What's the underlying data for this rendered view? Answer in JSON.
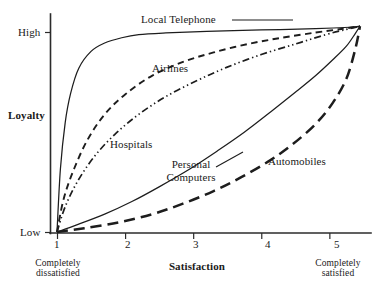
{
  "chart_data": {
    "type": "line",
    "title": "",
    "xlabel": "Satisfaction",
    "ylabel": "Loyalty",
    "xlim": [
      1,
      5.45
    ],
    "ylim": [
      0,
      1
    ],
    "grid": false,
    "legend_position": "inline-annotations",
    "x_tick_labels": [
      "1",
      "2",
      "3",
      "4",
      "5"
    ],
    "x_tick_values": [
      1,
      2,
      3,
      4,
      5
    ],
    "y_tick_labels": [
      "Low",
      "High"
    ],
    "y_tick_values": [
      0,
      0.93
    ],
    "x_axis_endcaps": [
      "Completely dissatisfied",
      "Completely satisfied"
    ],
    "series": [
      {
        "name": "Local Telephone",
        "style": "solid-thin",
        "x": [
          1.0,
          1.05,
          1.12,
          1.2,
          1.32,
          1.5,
          1.7,
          1.95,
          2.2,
          2.6,
          3.2,
          4.0,
          4.8,
          5.3,
          5.45
        ],
        "y": [
          0.0,
          0.3,
          0.52,
          0.66,
          0.78,
          0.86,
          0.9,
          0.925,
          0.94,
          0.948,
          0.955,
          0.962,
          0.968,
          0.975,
          0.98
        ]
      },
      {
        "name": "Airlines",
        "style": "dashed-medium",
        "x": [
          1.0,
          1.1,
          1.25,
          1.45,
          1.7,
          2.0,
          2.4,
          2.85,
          3.3,
          3.8,
          4.3,
          4.8,
          5.2,
          5.45
        ],
        "y": [
          0.0,
          0.16,
          0.3,
          0.44,
          0.56,
          0.655,
          0.745,
          0.81,
          0.855,
          0.895,
          0.925,
          0.95,
          0.968,
          0.98
        ]
      },
      {
        "name": "Hospitals",
        "style": "dash-dot-dot",
        "x": [
          1.0,
          1.12,
          1.3,
          1.55,
          1.85,
          2.2,
          2.6,
          3.05,
          3.5,
          4.0,
          4.5,
          4.95,
          5.25,
          5.45
        ],
        "y": [
          0.0,
          0.12,
          0.24,
          0.36,
          0.465,
          0.56,
          0.645,
          0.72,
          0.785,
          0.845,
          0.895,
          0.94,
          0.965,
          0.98
        ]
      },
      {
        "name": "Personal Computers",
        "style": "solid-thin",
        "x": [
          1.0,
          1.3,
          1.7,
          2.1,
          2.5,
          2.95,
          3.35,
          3.75,
          4.15,
          4.5,
          4.8,
          5.05,
          5.25,
          5.38,
          5.45
        ],
        "y": [
          0.0,
          0.035,
          0.085,
          0.145,
          0.215,
          0.3,
          0.385,
          0.475,
          0.575,
          0.665,
          0.745,
          0.82,
          0.885,
          0.945,
          0.98
        ]
      },
      {
        "name": "Automobiles",
        "style": "dashed-long",
        "x": [
          1.0,
          1.4,
          1.9,
          2.4,
          2.85,
          3.3,
          3.7,
          4.1,
          4.45,
          4.8,
          5.05,
          5.25,
          5.38,
          5.45
        ],
        "y": [
          0.0,
          0.018,
          0.045,
          0.085,
          0.135,
          0.195,
          0.26,
          0.335,
          0.415,
          0.515,
          0.615,
          0.73,
          0.87,
          0.98
        ]
      }
    ]
  },
  "axes": {
    "y_label": "Loyalty",
    "y_high": "High",
    "y_low": "Low",
    "x_label": "Satisfaction",
    "tick_1": "1",
    "tick_2": "2",
    "tick_3": "3",
    "tick_4": "4",
    "tick_5": "5",
    "left_cap_line1": "Completely",
    "left_cap_line2": "dissatisfied",
    "right_cap_line1": "Completely",
    "right_cap_line2": "satisfied"
  },
  "annotations": {
    "local_telephone": "Local Telephone",
    "airlines": "Airlines",
    "hospitals": "Hospitals",
    "personal_computers_line1": "Personal",
    "personal_computers_line2": "Computers",
    "automobiles": "Automobiles"
  },
  "colors": {
    "ink": "#1d1d1d",
    "axis": "#2b2b2b",
    "background": "#ffffff"
  }
}
